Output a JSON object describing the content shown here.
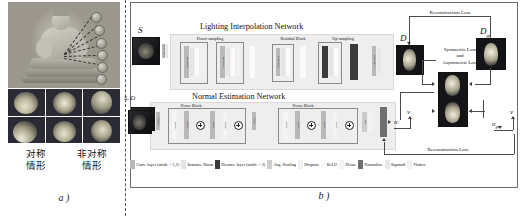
{
  "figure": {
    "panel_a_label": "a )",
    "panel_b_label": "b )"
  },
  "panel_a": {
    "name": "input-illumination-examples",
    "photo_caption": "buddha-statue-with-light-positions",
    "light_count": 6,
    "columns": [
      {
        "label_line1": "对称",
        "label_line2": "情形"
      },
      {
        "label_line1": "非对称",
        "label_line2": "情形"
      }
    ],
    "sphere_tiles": [
      "sphere-symmetric-1",
      "sphere-asymmetric-1",
      "sphere-asymmetric-2",
      "sphere-symmetric-2",
      "sphere-asymmetric-3",
      "sphere-asymmetric-4"
    ]
  },
  "panel_b": {
    "networks": [
      {
        "title": "Lighting Interpolation Network",
        "groups": [
          {
            "label": "Down-sampling"
          },
          {
            "label": "Residual Block"
          },
          {
            "label": "Up-sampling"
          }
        ]
      },
      {
        "title": "Normal Estimation Network",
        "groups": [
          {
            "label": "Dense Block"
          },
          {
            "label": "Dense Block"
          }
        ]
      }
    ],
    "io_labels": {
      "input_s": "S",
      "input_sd": "S, D",
      "output_d": "D",
      "ground_truth_d": "D_gt",
      "normal": "n",
      "view": "v",
      "normal_gt": "n_gt",
      "view_gt": "v"
    },
    "losses": [
      {
        "name": "reconstruction-loss-top",
        "text": "Reconstruction Loss"
      },
      {
        "name": "symmetric-asymmetric-loss",
        "line1": "Symmetric Loss",
        "line2": "and",
        "line3": "Asymmetric Loss"
      },
      {
        "name": "reconstruction-loss-bottom",
        "text": "Reconstruction Loss"
      }
    ],
    "legend": [
      {
        "key": "conv",
        "swatch": "#b9b9b9",
        "label": "Conv. layer (stride = 1,2)"
      },
      {
        "key": "inorm",
        "swatch": "#e4e4e4",
        "label": "Instance Norm"
      },
      {
        "key": "deconv",
        "swatch": "#3a3a3a",
        "label": "Deconv. layer (stride = 2)"
      },
      {
        "key": "avgpool",
        "swatch": "#cccccc",
        "label": "Avg. Pooling"
      },
      {
        "key": "dropout",
        "swatch": "#f0f0f0",
        "label": "Dropout"
      },
      {
        "key": "relu",
        "swatch": "#fafafa",
        "label": "ReLU"
      },
      {
        "key": "dense",
        "swatch": "#f4f4f4",
        "label": "Dense"
      },
      {
        "key": "norm",
        "swatch": "#6e6e6e",
        "label": "Normalize"
      },
      {
        "key": "sigmoid",
        "swatch": "#e8e8e8",
        "label": "Sigmoid"
      },
      {
        "key": "flatten",
        "swatch": "#f2f2f2",
        "label": "Flatten"
      }
    ],
    "layer_stack_labels": {
      "lin_enc": [
        "64 x 64 x 32",
        "32 x 32 x 64",
        "16 x 16 x 128"
      ],
      "lin_dec": [
        "32 x 32 x 64",
        "64 x 64 x 32",
        "128 x 128 x 3"
      ],
      "nen": [
        "64 x 64",
        "32 x 32",
        "16 x 16",
        "8 x 8"
      ]
    }
  },
  "colors": {
    "line": "#4a4a4a",
    "band": "#eeeeee",
    "border": "#6a6a6a",
    "text": "#111111"
  }
}
